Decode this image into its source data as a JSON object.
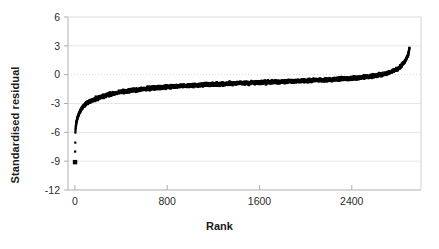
{
  "chart_data": {
    "type": "scatter",
    "title": "",
    "xlabel": "Rank",
    "ylabel": "Standardised residual",
    "xlim": [
      -60,
      3000
    ],
    "ylim": [
      -12,
      6
    ],
    "xticks": [
      0,
      800,
      1600,
      2400
    ],
    "xtick_labels": [
      "0",
      "800",
      "1600",
      "2400"
    ],
    "yticks": [
      6,
      3,
      0,
      -3,
      -6,
      -9,
      -12
    ],
    "ytick_labels": [
      "6",
      "3",
      "0",
      "-3",
      "-6",
      "-9",
      "-12"
    ],
    "grid": true,
    "gridlines": "horizontal light solid at each y tick, dotted emphasis at y=0",
    "legend": null,
    "n_points": 2900,
    "marker": "filled-square",
    "marker_color": "#000000",
    "marker_size_px": 2.2,
    "series": [
      {
        "name": "Standardised residual by rank",
        "anchors_x": [
          1,
          4,
          8,
          14,
          22,
          34,
          50,
          70,
          95,
          125,
          160,
          200,
          250,
          310,
          380,
          460,
          560,
          680,
          820,
          980,
          1160,
          1360,
          1580,
          1800,
          2020,
          2240,
          2440,
          2600,
          2720,
          2810,
          2860,
          2890,
          2900
        ],
        "anchors_y": [
          -9.1,
          -6.0,
          -5.4,
          -4.9,
          -4.5,
          -4.1,
          -3.7,
          -3.35,
          -3.05,
          -2.8,
          -2.6,
          -2.42,
          -2.22,
          -2.02,
          -1.85,
          -1.7,
          -1.55,
          -1.4,
          -1.26,
          -1.14,
          -1.02,
          -0.92,
          -0.82,
          -0.72,
          -0.62,
          -0.5,
          -0.34,
          -0.12,
          0.2,
          0.7,
          1.35,
          2.1,
          2.8
        ],
        "band_halfwidth": 0.26
      }
    ],
    "outliers": [
      {
        "x": 1,
        "y": -9.1,
        "note": "single extreme low residual"
      }
    ],
    "axis_color": "#b0b0b0",
    "grid_color": "#d9d9d9",
    "zero_line_style": "dotted",
    "plot_area_px": {
      "left": 68,
      "top": 17,
      "right": 421,
      "bottom": 190
    }
  }
}
